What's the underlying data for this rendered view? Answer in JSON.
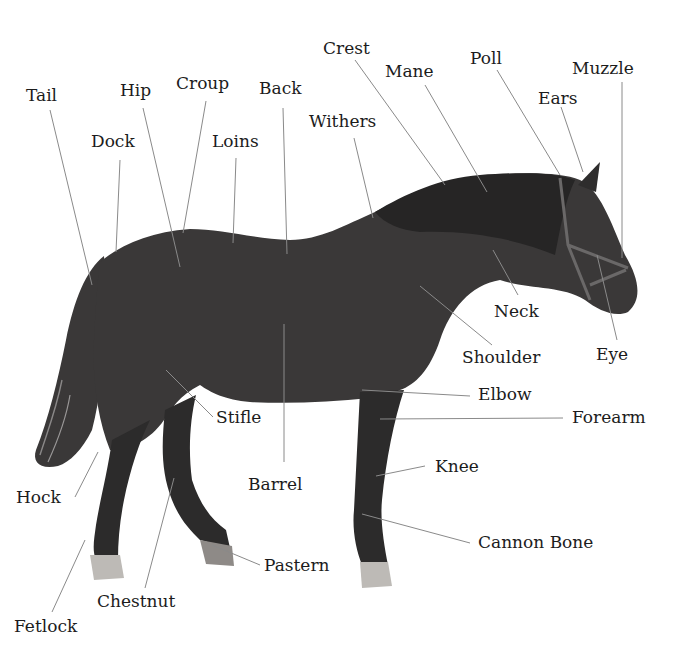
{
  "diagram": {
    "labels": [
      {
        "text": "Crest",
        "x": 323,
        "y": 40
      },
      {
        "text": "Poll",
        "x": 470,
        "y": 50
      },
      {
        "text": "Mane",
        "x": 385,
        "y": 63
      },
      {
        "text": "Muzzle",
        "x": 572,
        "y": 60
      },
      {
        "text": "Tail",
        "x": 26,
        "y": 87
      },
      {
        "text": "Hip",
        "x": 120,
        "y": 82
      },
      {
        "text": "Croup",
        "x": 176,
        "y": 75
      },
      {
        "text": "Back",
        "x": 259,
        "y": 80
      },
      {
        "text": "Ears",
        "x": 538,
        "y": 90
      },
      {
        "text": "Withers",
        "x": 309,
        "y": 113
      },
      {
        "text": "Dock",
        "x": 91,
        "y": 133
      },
      {
        "text": "Loins",
        "x": 212,
        "y": 133
      },
      {
        "text": "Neck",
        "x": 494,
        "y": 303
      },
      {
        "text": "Eye",
        "x": 596,
        "y": 346
      },
      {
        "text": "Shoulder",
        "x": 462,
        "y": 349
      },
      {
        "text": "Elbow",
        "x": 478,
        "y": 386
      },
      {
        "text": "Forearm",
        "x": 572,
        "y": 409
      },
      {
        "text": "Stifle",
        "x": 216,
        "y": 409
      },
      {
        "text": "Knee",
        "x": 435,
        "y": 458
      },
      {
        "text": "Barrel",
        "x": 248,
        "y": 476
      },
      {
        "text": "Hock",
        "x": 16,
        "y": 489
      },
      {
        "text": "Cannon Bone",
        "x": 478,
        "y": 534
      },
      {
        "text": "Pastern",
        "x": 264,
        "y": 557
      },
      {
        "text": "Chestnut",
        "x": 97,
        "y": 593
      },
      {
        "text": "Fetlock",
        "x": 14,
        "y": 618
      }
    ],
    "leader_lines": [
      {
        "part": "Crest",
        "x1": 355,
        "y1": 60,
        "x2": 445,
        "y2": 185
      },
      {
        "part": "Mane",
        "x1": 425,
        "y1": 85,
        "x2": 487,
        "y2": 192
      },
      {
        "part": "Poll",
        "x1": 497,
        "y1": 70,
        "x2": 560,
        "y2": 175
      },
      {
        "part": "Ears",
        "x1": 561,
        "y1": 107,
        "x2": 583,
        "y2": 172
      },
      {
        "part": "Muzzle",
        "x1": 622,
        "y1": 82,
        "x2": 622,
        "y2": 258
      },
      {
        "part": "Eye",
        "x1": 617,
        "y1": 340,
        "x2": 597,
        "y2": 255
      },
      {
        "part": "Tail",
        "x1": 50,
        "y1": 110,
        "x2": 92,
        "y2": 285
      },
      {
        "part": "Dock",
        "x1": 120,
        "y1": 160,
        "x2": 116,
        "y2": 252
      },
      {
        "part": "Hip",
        "x1": 143,
        "y1": 108,
        "x2": 180,
        "y2": 267
      },
      {
        "part": "Croup",
        "x1": 206,
        "y1": 101,
        "x2": 183,
        "y2": 233
      },
      {
        "part": "Loins",
        "x1": 236,
        "y1": 158,
        "x2": 233,
        "y2": 243
      },
      {
        "part": "Back",
        "x1": 283,
        "y1": 108,
        "x2": 287,
        "y2": 254
      },
      {
        "part": "Withers",
        "x1": 354,
        "y1": 138,
        "x2": 373,
        "y2": 218
      },
      {
        "part": "Neck",
        "x1": 518,
        "y1": 295,
        "x2": 493,
        "y2": 250
      },
      {
        "part": "Shoulder",
        "x1": 492,
        "y1": 345,
        "x2": 420,
        "y2": 286
      },
      {
        "part": "Elbow",
        "x1": 470,
        "y1": 396,
        "x2": 362,
        "y2": 390
      },
      {
        "part": "Forearm",
        "x1": 563,
        "y1": 418,
        "x2": 380,
        "y2": 419
      },
      {
        "part": "Knee",
        "x1": 425,
        "y1": 466,
        "x2": 376,
        "y2": 476
      },
      {
        "part": "Cannon Bone",
        "x1": 470,
        "y1": 543,
        "x2": 362,
        "y2": 514
      },
      {
        "part": "Stifle",
        "x1": 213,
        "y1": 417,
        "x2": 166,
        "y2": 370
      },
      {
        "part": "Barrel",
        "x1": 284,
        "y1": 462,
        "x2": 284,
        "y2": 324
      },
      {
        "part": "Hock",
        "x1": 75,
        "y1": 497,
        "x2": 98,
        "y2": 452
      },
      {
        "part": "Chestnut",
        "x1": 145,
        "y1": 588,
        "x2": 174,
        "y2": 478
      },
      {
        "part": "Pastern",
        "x1": 260,
        "y1": 565,
        "x2": 212,
        "y2": 545
      },
      {
        "part": "Fetlock",
        "x1": 52,
        "y1": 612,
        "x2": 85,
        "y2": 540
      }
    ],
    "colors": {
      "background": "#ffffff",
      "label_text": "#1c1c1c",
      "leader_line": "#8a8a8a",
      "coat": "#3a3838",
      "coat_dark": "#262525",
      "hoof_light": "#bdbab6"
    }
  }
}
